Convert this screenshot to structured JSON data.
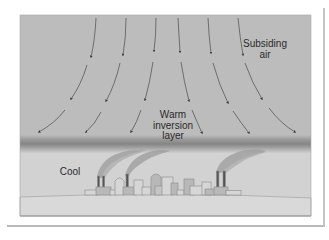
{
  "figure": {
    "labels": {
      "subsiding_line1": "Subsiding",
      "subsiding_line2": "air",
      "warm_line1": "Warm",
      "warm_line2": "inversion",
      "warm_line3": "layer",
      "cool": "Cool"
    },
    "colors": {
      "sky": "#bcbcbc",
      "inversion_band": "#868686",
      "cool_air": "#d2d2d2",
      "ground": "#d9d9d9",
      "arrow": "#4a4a4a",
      "building_fill": "#d6d6d6",
      "building_dark": "#b4b4b4",
      "smoke": "#9a9a9a",
      "chimney": "#555555"
    },
    "arrow_columns": 6,
    "arrow_segments_per_column": 3,
    "smokestacks": 5
  }
}
